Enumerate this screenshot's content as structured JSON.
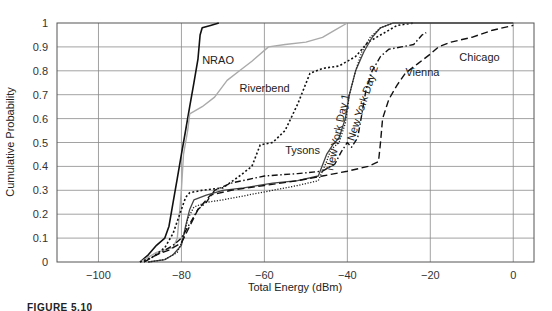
{
  "figure": {
    "caption": "FIGURE 5.10"
  },
  "chart_data": {
    "type": "line",
    "title": "",
    "xlabel": "Total Energy (dBm)",
    "ylabel": "Cumulative Probability",
    "xlim": [
      -110,
      5
    ],
    "ylim": [
      0,
      1
    ],
    "xticks": [
      -100,
      -80,
      -60,
      -40,
      -20,
      0
    ],
    "xtick_labels": [
      "−100",
      "−80",
      "−60",
      "−40",
      "−20",
      "0"
    ],
    "yticks": [
      0,
      0.1,
      0.2,
      0.3,
      0.4,
      0.5,
      0.6,
      0.7,
      0.8,
      0.9,
      1
    ],
    "ytick_labels": [
      "0",
      "0.1",
      "0.2",
      "0.3",
      "0.4",
      "0.5",
      "0.6",
      "0.7",
      "0.8",
      "0.9",
      "1"
    ],
    "grid": true,
    "legend": "inline labels",
    "series": [
      {
        "name": "NRAO",
        "style": "solid",
        "color": "#111111",
        "width": 1.6,
        "label_pos": [
          -75,
          0.83
        ],
        "label_rotate": 0,
        "points": [
          [
            -90,
            0
          ],
          [
            -88,
            0.03
          ],
          [
            -86,
            0.07
          ],
          [
            -84,
            0.1
          ],
          [
            -83,
            0.15
          ],
          [
            -82,
            0.25
          ],
          [
            -81,
            0.35
          ],
          [
            -80,
            0.45
          ],
          [
            -79,
            0.55
          ],
          [
            -78,
            0.65
          ],
          [
            -77,
            0.75
          ],
          [
            -76,
            0.85
          ],
          [
            -75.5,
            0.95
          ],
          [
            -75,
            0.98
          ],
          [
            -73,
            0.99
          ],
          [
            -71,
            1.0
          ]
        ]
      },
      {
        "name": "Riverbend",
        "style": "solid",
        "color": "#aaaaaa",
        "width": 1.4,
        "label_pos": [
          -66,
          0.71
        ],
        "label_rotate": 0,
        "points": [
          [
            -90,
            0
          ],
          [
            -86,
            0.04
          ],
          [
            -82,
            0.06
          ],
          [
            -81,
            0.1
          ],
          [
            -80.5,
            0.2
          ],
          [
            -80,
            0.3
          ],
          [
            -79.5,
            0.45
          ],
          [
            -78.5,
            0.55
          ],
          [
            -78,
            0.62
          ],
          [
            -75,
            0.65
          ],
          [
            -72,
            0.69
          ],
          [
            -69,
            0.76
          ],
          [
            -66,
            0.8
          ],
          [
            -63,
            0.84
          ],
          [
            -59,
            0.9
          ],
          [
            -55,
            0.91
          ],
          [
            -50,
            0.92
          ],
          [
            -46,
            0.94
          ],
          [
            -43,
            0.97
          ],
          [
            -40,
            1.0
          ]
        ]
      },
      {
        "name": "Tysons",
        "style": "dotted-dense",
        "color": "#111111",
        "width": 1.6,
        "label_pos": [
          -55,
          0.45
        ],
        "label_rotate": 0,
        "points": [
          [
            -90,
            0
          ],
          [
            -87,
            0.02
          ],
          [
            -84,
            0.06
          ],
          [
            -82,
            0.12
          ],
          [
            -80,
            0.22
          ],
          [
            -79,
            0.27
          ],
          [
            -78,
            0.29
          ],
          [
            -75,
            0.3
          ],
          [
            -70,
            0.31
          ],
          [
            -66,
            0.36
          ],
          [
            -63,
            0.4
          ],
          [
            -61,
            0.49
          ],
          [
            -58,
            0.5
          ],
          [
            -55,
            0.55
          ],
          [
            -52,
            0.66
          ],
          [
            -49,
            0.79
          ],
          [
            -46,
            0.81
          ],
          [
            -42,
            0.82
          ],
          [
            -38,
            0.86
          ],
          [
            -35,
            0.92
          ],
          [
            -31,
            0.96
          ],
          [
            -28,
            0.99
          ],
          [
            -24,
            1.0
          ]
        ]
      },
      {
        "name": "New York Day 1",
        "style": "solid",
        "color": "#444444",
        "width": 1.3,
        "label_pos": [
          -41.5,
          0.54
        ],
        "label_rotate": -78,
        "points": [
          [
            -88,
            0
          ],
          [
            -84,
            0.01
          ],
          [
            -82,
            0.03
          ],
          [
            -80,
            0.07
          ],
          [
            -79,
            0.15
          ],
          [
            -78,
            0.22
          ],
          [
            -77,
            0.26
          ],
          [
            -74,
            0.28
          ],
          [
            -70,
            0.3
          ],
          [
            -65,
            0.31
          ],
          [
            -58,
            0.33
          ],
          [
            -52,
            0.34
          ],
          [
            -47,
            0.36
          ],
          [
            -45,
            0.45
          ],
          [
            -43.5,
            0.49
          ],
          [
            -42,
            0.52
          ],
          [
            -40.5,
            0.6
          ],
          [
            -39.5,
            0.7
          ],
          [
            -38,
            0.8
          ],
          [
            -36,
            0.88
          ],
          [
            -34,
            0.94
          ],
          [
            -32,
            0.98
          ],
          [
            -29,
            1.0
          ],
          [
            -10,
            1.0
          ],
          [
            0,
            1.0
          ]
        ]
      },
      {
        "name": "New York Day 2",
        "style": "dotted",
        "color": "#222222",
        "width": 1.3,
        "label_pos": [
          -35.5,
          0.66
        ],
        "label_rotate": -72,
        "points": [
          [
            -88,
            0
          ],
          [
            -84,
            0.01
          ],
          [
            -81,
            0.04
          ],
          [
            -79.5,
            0.1
          ],
          [
            -78.5,
            0.18
          ],
          [
            -77,
            0.23
          ],
          [
            -74,
            0.25
          ],
          [
            -70,
            0.26
          ],
          [
            -64,
            0.28
          ],
          [
            -58,
            0.3
          ],
          [
            -52,
            0.32
          ],
          [
            -47,
            0.34
          ],
          [
            -45,
            0.42
          ],
          [
            -44,
            0.47
          ],
          [
            -42,
            0.5
          ],
          [
            -40.5,
            0.58
          ],
          [
            -39.5,
            0.7
          ],
          [
            -38,
            0.8
          ],
          [
            -36.5,
            0.88
          ],
          [
            -34.5,
            0.94
          ],
          [
            -32,
            0.98
          ],
          [
            -29,
            1.0
          ]
        ]
      },
      {
        "name": "Vienna",
        "style": "dashdot",
        "color": "#111111",
        "width": 1.4,
        "label_pos": [
          -26,
          0.78
        ],
        "label_rotate": 0,
        "points": [
          [
            -89,
            0
          ],
          [
            -86,
            0.03
          ],
          [
            -84,
            0.05
          ],
          [
            -82,
            0.07
          ],
          [
            -80,
            0.1
          ],
          [
            -78,
            0.16
          ],
          [
            -76,
            0.22
          ],
          [
            -74,
            0.25
          ],
          [
            -72,
            0.3
          ],
          [
            -68,
            0.33
          ],
          [
            -60,
            0.36
          ],
          [
            -52,
            0.37
          ],
          [
            -46,
            0.38
          ],
          [
            -43,
            0.41
          ],
          [
            -41.5,
            0.46
          ],
          [
            -40,
            0.5
          ],
          [
            -39,
            0.48
          ],
          [
            -37.5,
            0.52
          ],
          [
            -36.5,
            0.62
          ],
          [
            -35.5,
            0.72
          ],
          [
            -34,
            0.8
          ],
          [
            -32,
            0.86
          ],
          [
            -30,
            0.89
          ],
          [
            -27,
            0.9
          ],
          [
            -24,
            0.91
          ],
          [
            -22,
            0.95
          ],
          [
            -21,
            0.96
          ]
        ]
      },
      {
        "name": "Chicago",
        "style": "dashed-long",
        "color": "#111111",
        "width": 1.4,
        "label_pos": [
          -13,
          0.84
        ],
        "label_rotate": 0,
        "points": [
          [
            -89,
            0
          ],
          [
            -86,
            0.03
          ],
          [
            -83,
            0.05
          ],
          [
            -80,
            0.08
          ],
          [
            -78,
            0.15
          ],
          [
            -76,
            0.22
          ],
          [
            -73,
            0.28
          ],
          [
            -68,
            0.3
          ],
          [
            -60,
            0.32
          ],
          [
            -52,
            0.34
          ],
          [
            -46,
            0.36
          ],
          [
            -40,
            0.38
          ],
          [
            -35,
            0.4
          ],
          [
            -32.5,
            0.42
          ],
          [
            -32,
            0.5
          ],
          [
            -31.5,
            0.6
          ],
          [
            -30,
            0.68
          ],
          [
            -28,
            0.74
          ],
          [
            -26,
            0.79
          ],
          [
            -23,
            0.83
          ],
          [
            -20,
            0.87
          ],
          [
            -18,
            0.9
          ],
          [
            -15,
            0.92
          ],
          [
            -10,
            0.94
          ],
          [
            -5,
            0.97
          ],
          [
            0,
            0.99
          ]
        ]
      }
    ]
  }
}
